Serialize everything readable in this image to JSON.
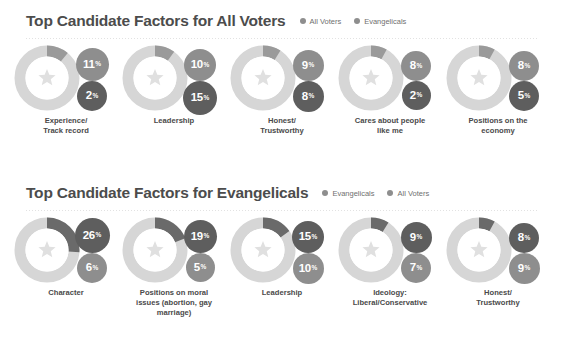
{
  "chart_data": {
    "type": "bar",
    "title": "Top Candidate Factors",
    "xlabel": "",
    "ylabel": "Percent",
    "sections": [
      {
        "title": "Top Candidate Factors for All Voters",
        "legend": [
          {
            "label": "All Voters",
            "color": "#8e8e8e"
          },
          {
            "label": "Evangelicals",
            "color": "#8e8e8e"
          }
        ],
        "series": [
          {
            "name": "All Voters",
            "values": [
              11,
              10,
              9,
              8,
              8
            ]
          },
          {
            "name": "Evangelicals",
            "values": [
              2,
              15,
              8,
              2,
              5
            ]
          }
        ],
        "categories": [
          "Experience/\nTrack record",
          "Leadership",
          "Honest/\nTrustworthy",
          "Cares about people\nlike me",
          "Positions on the\neconomy"
        ],
        "groups": [
          {
            "label_lines": [
              "Experience/",
              "Track record"
            ],
            "arc_pct": 11,
            "top": {
              "value": "11",
              "suffix": "%",
              "color": "#8e8e8e",
              "size": 33
            },
            "bottom": {
              "value": "2",
              "suffix": "%",
              "color": "#5e5e5e",
              "size": 30
            }
          },
          {
            "label_lines": [
              "Leadership"
            ],
            "arc_pct": 10,
            "top": {
              "value": "10",
              "suffix": "%",
              "color": "#8e8e8e",
              "size": 32
            },
            "bottom": {
              "value": "15",
              "suffix": "%",
              "color": "#5e5e5e",
              "size": 34
            }
          },
          {
            "label_lines": [
              "Honest/",
              "Trustworthy"
            ],
            "arc_pct": 9,
            "top": {
              "value": "9",
              "suffix": "%",
              "color": "#8e8e8e",
              "size": 31
            },
            "bottom": {
              "value": "8",
              "suffix": "%",
              "color": "#5e5e5e",
              "size": 31
            }
          },
          {
            "label_lines": [
              "Cares about people",
              "like me"
            ],
            "arc_pct": 8,
            "top": {
              "value": "8",
              "suffix": "%",
              "color": "#8e8e8e",
              "size": 30
            },
            "bottom": {
              "value": "2",
              "suffix": "%",
              "color": "#5e5e5e",
              "size": 29
            }
          },
          {
            "label_lines": [
              "Positions on the",
              "economy"
            ],
            "arc_pct": 8,
            "top": {
              "value": "8",
              "suffix": "%",
              "color": "#8e8e8e",
              "size": 30
            },
            "bottom": {
              "value": "5",
              "suffix": "%",
              "color": "#5e5e5e",
              "size": 30
            }
          }
        ]
      },
      {
        "title": "Top Candidate Factors for Evangelicals",
        "legend": [
          {
            "label": "Evangelicals",
            "color": "#8e8e8e"
          },
          {
            "label": "All Voters",
            "color": "#8e8e8e"
          }
        ],
        "series": [
          {
            "name": "Evangelicals",
            "values": [
              26,
              19,
              15,
              9,
              8
            ]
          },
          {
            "name": "All Voters",
            "values": [
              6,
              5,
              10,
              7,
              9
            ]
          }
        ],
        "categories": [
          "Character",
          "Positions on moral\nissues (abortion, gay\nmarriage)",
          "Leadership",
          "Ideology:\nLiberal/Conservative",
          "Honest/\nTrustworthy"
        ],
        "groups": [
          {
            "label_lines": [
              "Character"
            ],
            "arc_pct": 26,
            "top": {
              "value": "26",
              "suffix": "%",
              "color": "#5e5e5e",
              "size": 35
            },
            "bottom": {
              "value": "6",
              "suffix": "%",
              "color": "#8e8e8e",
              "size": 30
            }
          },
          {
            "label_lines": [
              "Positions on moral",
              "issues (abortion, gay",
              "marriage)"
            ],
            "arc_pct": 19,
            "top": {
              "value": "19",
              "suffix": "%",
              "color": "#5e5e5e",
              "size": 33
            },
            "bottom": {
              "value": "5",
              "suffix": "%",
              "color": "#8e8e8e",
              "size": 29
            }
          },
          {
            "label_lines": [
              "Leadership"
            ],
            "arc_pct": 15,
            "top": {
              "value": "15",
              "suffix": "%",
              "color": "#5e5e5e",
              "size": 32
            },
            "bottom": {
              "value": "10",
              "suffix": "%",
              "color": "#8e8e8e",
              "size": 31
            }
          },
          {
            "label_lines": [
              "Ideology:",
              "Liberal/Conservative"
            ],
            "arc_pct": 9,
            "top": {
              "value": "9",
              "suffix": "%",
              "color": "#5e5e5e",
              "size": 31
            },
            "bottom": {
              "value": "7",
              "suffix": "%",
              "color": "#8e8e8e",
              "size": 30
            }
          },
          {
            "label_lines": [
              "Honest/",
              "Trustworthy"
            ],
            "arc_pct": 8,
            "top": {
              "value": "8",
              "suffix": "%",
              "color": "#5e5e5e",
              "size": 30
            },
            "bottom": {
              "value": "9",
              "suffix": "%",
              "color": "#8e8e8e",
              "size": 31
            }
          }
        ]
      }
    ],
    "colors": {
      "ring_base": "#d6d6d6",
      "ring_arc_light": "#9a9a9a",
      "ring_arc_dark": "#6a6a6a",
      "inner": "#ffffff",
      "star": "#e0e0e0",
      "text": "#4a4a4a",
      "background": "#ffffff"
    },
    "icons": {
      "center": "star-icon"
    },
    "grid": false,
    "legend_position": "top-right"
  }
}
